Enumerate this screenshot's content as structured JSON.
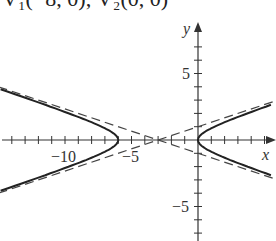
{
  "caption": "V₁(−8, 0); V₂(0, 0)",
  "chart_data": {
    "type": "line",
    "title": "",
    "xlabel": "x",
    "ylabel": "y",
    "xticks_labeled": [
      -10,
      -5
    ],
    "yticks_labeled": [
      5,
      -5
    ],
    "x_tick_labels": [
      "−10",
      "−5"
    ],
    "y_tick_labels": [
      "5",
      "−5"
    ],
    "xlim": [
      -15,
      6
    ],
    "ylim": [
      -8,
      8
    ],
    "grid": false,
    "series": [
      {
        "name": "hyperbola",
        "style": "solid",
        "equation": "(x+3)^2/9 - y^2 = 1",
        "center": [
          -3,
          0
        ],
        "vertices": [
          [
            -6,
            0
          ],
          [
            0,
            0
          ]
        ]
      },
      {
        "name": "asymptote 1",
        "style": "dashed",
        "equation": "y = (x+3)/3"
      },
      {
        "name": "asymptote 2",
        "style": "dashed",
        "equation": "y = -(x+3)/3"
      }
    ]
  },
  "axes": {
    "x_label": "x",
    "y_label": "y",
    "x_neg10": "−10",
    "x_neg5": "−5",
    "y_5": "5",
    "y_neg5": "−5"
  }
}
